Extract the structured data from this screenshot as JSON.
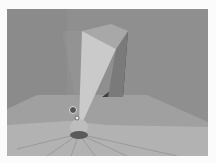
{
  "image": {
    "description": "Grayscale 3D render of a room corner with a tall tapered light beam rising from a small fixture on the floor",
    "colors": {
      "page_background": "#fbfbfb",
      "back_wall": "#8f8f8f",
      "left_wall": "#8a8a8a",
      "floor_far": "#a3a3a3",
      "floor_near": "#b8b8b8",
      "beam_lit": "#c9c9c9",
      "beam_top": "#a6a6a6",
      "beam_shadow": "#3c3c3c",
      "fixture": "#5a5a5a"
    }
  }
}
